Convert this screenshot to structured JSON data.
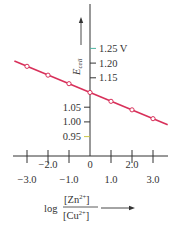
{
  "chart_data": {
    "type": "line",
    "title": "",
    "xlabel": "log [Zn2+]/[Cu2+]",
    "ylabel": "E_cell",
    "y_unit": "V",
    "x": [
      -3,
      -2,
      -1,
      0,
      1,
      2,
      3
    ],
    "series": [
      {
        "name": "E_cell",
        "color": "#d8305a",
        "values": [
          1.189,
          1.159,
          1.13,
          1.1,
          1.07,
          1.041,
          1.011
        ],
        "markers": "open-circle"
      }
    ],
    "xlim": [
      -3.3,
      3.5
    ],
    "ylim": [
      0.95,
      1.25
    ],
    "x_ticks": [
      {
        "value": -3,
        "label": "−3.0",
        "row": "lower"
      },
      {
        "value": -2,
        "label": "−2.0",
        "row": "upper"
      },
      {
        "value": -1,
        "label": "−1.0",
        "row": "lower"
      },
      {
        "value": 0,
        "label": "0",
        "row": "upper"
      },
      {
        "value": 1,
        "label": "1.0",
        "row": "lower"
      },
      {
        "value": 2,
        "label": "2.0",
        "row": "upper"
      },
      {
        "value": 3,
        "label": "3.0",
        "row": "lower"
      }
    ],
    "y_ticks_right": [
      {
        "value": 1.25,
        "label": "1.25 V",
        "color": "#4fb3a0"
      },
      {
        "value": 1.2,
        "label": "1.20",
        "color": "#333333"
      },
      {
        "value": 1.15,
        "label": "1.15",
        "color": "#333333"
      }
    ],
    "y_ticks_left": [
      {
        "value": 1.05,
        "label": "1.05",
        "color": "#333333"
      },
      {
        "value": 1.0,
        "label": "1.00",
        "color": "#333333"
      },
      {
        "value": 0.95,
        "label": "0.95",
        "color": "#c9c84a"
      }
    ],
    "grid": false,
    "legend": null
  },
  "labels": {
    "y_axis_E": "E",
    "y_axis_sub": "cell",
    "x_axis_log": "log",
    "x_axis_num": "[Zn",
    "x_axis_num_sup": "2+",
    "x_axis_num_end": "]",
    "x_axis_den": "[Cu",
    "x_axis_den_sup": "2+",
    "x_axis_den_end": "]"
  }
}
